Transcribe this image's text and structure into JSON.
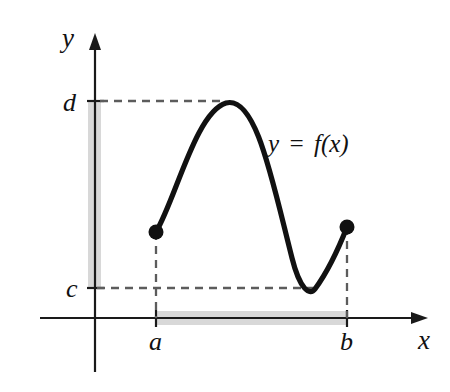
{
  "figure": {
    "background_color": "#ffffff",
    "curve_color": "#111111",
    "axis_color": "#1a1a1a",
    "dash_color": "#5c5c5c",
    "band_color": "#c9c9c9"
  },
  "axes": {
    "x_label": "x",
    "y_label": "y",
    "origin": {
      "x": 95,
      "y": 318
    },
    "x_axis_from_x": 40,
    "x_axis_to_x": 428,
    "y_axis_from_y": 372,
    "y_axis_to_y": 33
  },
  "ticks": {
    "x": [
      {
        "label": "a",
        "pixel_x": 156,
        "label_x": 152,
        "label_y": 348
      },
      {
        "label": "b",
        "pixel_x": 347,
        "label_x": 343,
        "label_y": 348
      }
    ],
    "y": [
      {
        "label": "d",
        "pixel_y": 101,
        "label_x": 63,
        "label_y": 111
      },
      {
        "label": "c",
        "pixel_y": 288,
        "label_x": 66,
        "label_y": 297
      }
    ]
  },
  "curve": {
    "equation_label": {
      "lhs": "y",
      "operator": "=",
      "rhs": "f(x)",
      "x": 270,
      "y": 152
    },
    "path": "M 156 232 C 176 198 196 112 226 103 C 256 95 272 180 292 258 C 300 290 310 296 315 289 C 326 274 338 250 347 227",
    "endpoints": [
      {
        "name": "left-endpoint",
        "x": 156,
        "y": 232,
        "r": 7.5,
        "filled": true
      },
      {
        "name": "right-endpoint",
        "x": 347,
        "y": 227,
        "r": 7.5,
        "filled": true
      }
    ],
    "maximum": {
      "x": 226,
      "y": 103
    },
    "minimum": {
      "x": 315,
      "y": 289
    }
  },
  "guides": {
    "dashed_d_horizontal": {
      "x1": 100,
      "y1": 101,
      "x2": 226,
      "y2": 101
    },
    "dashed_c_horizontal": {
      "x1": 97,
      "y1": 288,
      "x2": 315,
      "y2": 288
    },
    "dashed_a_vertical": {
      "x1": 156,
      "y1": 232,
      "x2": 156,
      "y2": 318
    },
    "dashed_b_vertical": {
      "x1": 347,
      "y1": 227,
      "x2": 347,
      "y2": 318
    }
  },
  "bands": {
    "range_band": {
      "x": 88,
      "y": 101,
      "width": 13,
      "height": 187,
      "description": "vertical gray band on y-axis from c to d"
    },
    "domain_band": {
      "x": 156,
      "y": 311,
      "width": 191,
      "height": 14,
      "description": "horizontal gray band on x-axis from a to b"
    }
  }
}
